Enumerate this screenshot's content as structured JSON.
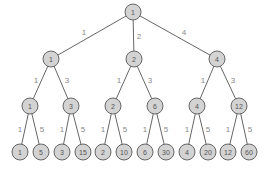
{
  "diagram": {
    "colors": {
      "node_fill": "#d3d3d3",
      "node_stroke": "#666666",
      "edge": "#666666",
      "label": "#888888"
    },
    "nodes": [
      {
        "id": "r",
        "label": "1",
        "x": 133,
        "y": 12
      },
      {
        "id": "a",
        "label": "1",
        "x": 51,
        "y": 59
      },
      {
        "id": "b",
        "label": "2",
        "x": 134,
        "y": 59
      },
      {
        "id": "c",
        "label": "4",
        "x": 217,
        "y": 59
      },
      {
        "id": "a1",
        "label": "1",
        "x": 30,
        "y": 106
      },
      {
        "id": "a2",
        "label": "3",
        "x": 71,
        "y": 106
      },
      {
        "id": "b1",
        "label": "2",
        "x": 113,
        "y": 106
      },
      {
        "id": "b2",
        "label": "6",
        "x": 155,
        "y": 106
      },
      {
        "id": "c1",
        "label": "4",
        "x": 197,
        "y": 106
      },
      {
        "id": "c2",
        "label": "12",
        "x": 239,
        "y": 106
      },
      {
        "id": "l1",
        "label": "1",
        "x": 20,
        "y": 152
      },
      {
        "id": "l2",
        "label": "5",
        "x": 41,
        "y": 152
      },
      {
        "id": "l3",
        "label": "3",
        "x": 62,
        "y": 152
      },
      {
        "id": "l4",
        "label": "15",
        "x": 83,
        "y": 152
      },
      {
        "id": "l5",
        "label": "2",
        "x": 103,
        "y": 152
      },
      {
        "id": "l6",
        "label": "10",
        "x": 124,
        "y": 152
      },
      {
        "id": "l7",
        "label": "6",
        "x": 145,
        "y": 152
      },
      {
        "id": "l8",
        "label": "30",
        "x": 166,
        "y": 152
      },
      {
        "id": "l9",
        "label": "4",
        "x": 187,
        "y": 152
      },
      {
        "id": "l10",
        "label": "20",
        "x": 208,
        "y": 152
      },
      {
        "id": "l11",
        "label": "12",
        "x": 228,
        "y": 152
      },
      {
        "id": "l12",
        "label": "60",
        "x": 249,
        "y": 152
      }
    ],
    "edges": [
      {
        "from": "r",
        "to": "a",
        "label": "1",
        "lx": 84,
        "ly": 32
      },
      {
        "from": "r",
        "to": "b",
        "label": "2",
        "lx": 139,
        "ly": 36
      },
      {
        "from": "r",
        "to": "c",
        "label": "4",
        "lx": 184,
        "ly": 32
      },
      {
        "from": "a",
        "to": "a1",
        "label": "1",
        "lx": 36,
        "ly": 80
      },
      {
        "from": "a",
        "to": "a2",
        "label": "3",
        "lx": 67,
        "ly": 80
      },
      {
        "from": "b",
        "to": "b1",
        "label": "1",
        "lx": 119,
        "ly": 80
      },
      {
        "from": "b",
        "to": "b2",
        "label": "3",
        "lx": 150,
        "ly": 80
      },
      {
        "from": "c",
        "to": "c1",
        "label": "1",
        "lx": 203,
        "ly": 80
      },
      {
        "from": "c",
        "to": "c2",
        "label": "3",
        "lx": 233,
        "ly": 80
      },
      {
        "from": "a1",
        "to": "l1",
        "label": "1",
        "lx": 20,
        "ly": 129
      },
      {
        "from": "a1",
        "to": "l2",
        "label": "5",
        "lx": 42,
        "ly": 129
      },
      {
        "from": "a2",
        "to": "l3",
        "label": "1",
        "lx": 62,
        "ly": 129
      },
      {
        "from": "a2",
        "to": "l4",
        "label": "5",
        "lx": 83,
        "ly": 129
      },
      {
        "from": "b1",
        "to": "l5",
        "label": "1",
        "lx": 103,
        "ly": 129
      },
      {
        "from": "b1",
        "to": "l6",
        "label": "5",
        "lx": 125,
        "ly": 129
      },
      {
        "from": "b2",
        "to": "l7",
        "label": "1",
        "lx": 145,
        "ly": 129
      },
      {
        "from": "b2",
        "to": "l8",
        "label": "5",
        "lx": 166,
        "ly": 129
      },
      {
        "from": "c1",
        "to": "l9",
        "label": "1",
        "lx": 187,
        "ly": 129
      },
      {
        "from": "c1",
        "to": "l10",
        "label": "5",
        "lx": 208,
        "ly": 129
      },
      {
        "from": "c2",
        "to": "l11",
        "label": "1",
        "lx": 228,
        "ly": 129
      },
      {
        "from": "c2",
        "to": "l12",
        "label": "5",
        "lx": 250,
        "ly": 129
      }
    ]
  }
}
